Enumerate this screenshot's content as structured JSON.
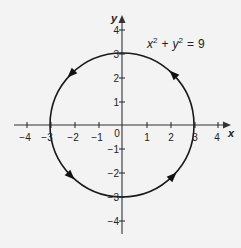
{
  "figure": {
    "type": "graph",
    "equation": {
      "lhs_x": "x",
      "lhs_y": "y",
      "exp": "2",
      "plus": "+",
      "equals": "=",
      "rhs": "9"
    },
    "x_axis": {
      "label": "x",
      "ticks": [
        -4,
        -3,
        -2,
        -1,
        0,
        1,
        2,
        3,
        4
      ]
    },
    "y_axis": {
      "label": "y",
      "ticks": [
        4,
        3,
        2,
        1,
        -1,
        -2,
        -3,
        -4
      ]
    },
    "tick_labels": {
      "x_m4": "−4",
      "x_m3": "−3",
      "x_m2": "−2",
      "x_m1": "−1",
      "origin": "0",
      "x_1": "1",
      "x_2": "2",
      "x_3": "3",
      "x_4": "4",
      "y_4": "4",
      "y_3": "3",
      "y_2": "2",
      "y_1": "1",
      "y_m1": "−1",
      "y_m2": "−2",
      "y_m3": "−3",
      "y_m4": "−4"
    },
    "curve": {
      "shape": "circle",
      "center": [
        0,
        0
      ],
      "radius": 3,
      "orientation": "counterclockwise",
      "arrow_count": 4
    },
    "colors": {
      "background": "#f3f3f3",
      "stroke": "#1a1a1a",
      "text": "#222222"
    }
  }
}
